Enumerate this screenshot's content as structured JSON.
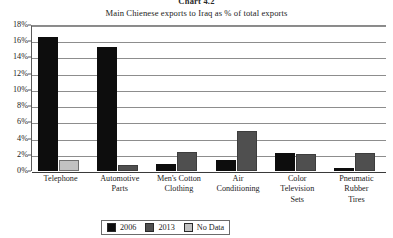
{
  "figure": {
    "number_label": "Chart 4.2",
    "title": "Main Chienese exports to Iraq as % of total exports"
  },
  "legend": {
    "items": [
      {
        "label": "2006",
        "color": "#0d0d0d"
      },
      {
        "label": "2013",
        "color": "#4f4f4f"
      },
      {
        "label": "No Data",
        "color": "#c2c2c2"
      }
    ]
  },
  "axis": {
    "y_ticks": [
      "0%",
      "2%",
      "4%",
      "6%",
      "8%",
      "10%",
      "12%",
      "14%",
      "16%",
      "18%"
    ]
  },
  "chart_data": {
    "type": "bar",
    "title": "Main Chienese exports to Iraq as % of total exports",
    "xlabel": "",
    "ylabel": "",
    "ylim": [
      0,
      18
    ],
    "ytick_step": 2,
    "ytick_suffix": "%",
    "grid": "horizontal",
    "legend_position": "bottom-center",
    "categories": [
      "Telephone",
      "Automotive Parts",
      "Men's Cotton Clothing",
      "Air Conditioning",
      "Color Television Sets",
      "Pneumatic Rubber Tires"
    ],
    "category_lines": [
      [
        "Telephone"
      ],
      [
        "Automotive",
        "Parts"
      ],
      [
        "Men's Cotton",
        "Clothing"
      ],
      [
        "Air",
        "Conditioning"
      ],
      [
        "Color",
        "Television",
        "Sets"
      ],
      [
        "Pneumatic",
        "Rubber",
        "Tires"
      ]
    ],
    "series": [
      {
        "name": "2006",
        "color": "#0d0d0d",
        "values": [
          16.5,
          15.3,
          0.9,
          1.4,
          2.2,
          0.4
        ]
      },
      {
        "name": "2013",
        "color": "#4f4f4f",
        "values": [
          null,
          0.8,
          2.4,
          4.9,
          2.1,
          2.2
        ]
      },
      {
        "name": "No Data",
        "color": "#c2c2c2",
        "values": [
          1.3,
          null,
          null,
          null,
          null,
          null
        ]
      }
    ]
  }
}
